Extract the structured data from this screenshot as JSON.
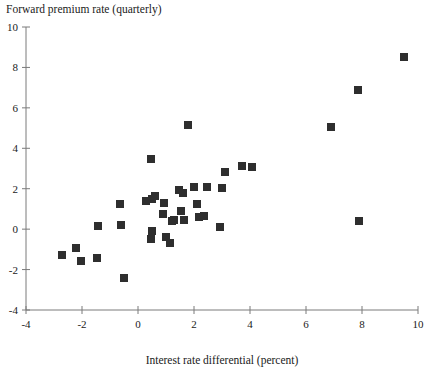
{
  "chart_data": {
    "type": "scatter",
    "title": "Forward premium rate (quarterly)",
    "xlabel": "Interest rate differential (percent)",
    "ylabel": "Forward premium rate (quarterly)",
    "xlim": [
      -4,
      10
    ],
    "ylim": [
      -4,
      10
    ],
    "xticks": [
      -4,
      -2,
      0,
      2,
      4,
      6,
      8,
      10
    ],
    "xtick_labels": [
      "-4",
      "-2",
      "0",
      "2",
      "4",
      "6",
      "8",
      "10"
    ],
    "yticks": [
      -4,
      -2,
      0,
      2,
      4,
      6,
      8,
      10
    ],
    "ytick_labels": [
      "-4",
      "-2",
      "0",
      "2",
      "4",
      "6",
      "8",
      "10"
    ],
    "grid": false,
    "legend": null,
    "marker": "square",
    "marker_color": "#2e2e2e",
    "marker_size": 8,
    "points": [
      {
        "x": -2.71,
        "y": -1.29
      },
      {
        "x": -2.21,
        "y": -0.94
      },
      {
        "x": -2.04,
        "y": -1.58
      },
      {
        "x": -1.46,
        "y": -1.44
      },
      {
        "x": -1.43,
        "y": 0.15
      },
      {
        "x": -0.61,
        "y": 0.2
      },
      {
        "x": -0.64,
        "y": 1.26
      },
      {
        "x": -0.5,
        "y": -2.43
      },
      {
        "x": 0.46,
        "y": 3.46
      },
      {
        "x": 0.29,
        "y": 1.39
      },
      {
        "x": 0.5,
        "y": 1.48
      },
      {
        "x": 0.61,
        "y": 1.63
      },
      {
        "x": 0.5,
        "y": -0.1
      },
      {
        "x": 0.46,
        "y": -0.49
      },
      {
        "x": 0.89,
        "y": 0.74
      },
      {
        "x": 0.93,
        "y": 1.29
      },
      {
        "x": 1.0,
        "y": -0.4
      },
      {
        "x": 1.14,
        "y": -0.69
      },
      {
        "x": 1.21,
        "y": 0.4
      },
      {
        "x": 1.29,
        "y": 0.45
      },
      {
        "x": 1.54,
        "y": 0.89
      },
      {
        "x": 1.61,
        "y": 1.78
      },
      {
        "x": 1.46,
        "y": 1.93
      },
      {
        "x": 1.79,
        "y": 5.15
      },
      {
        "x": 1.64,
        "y": 0.45
      },
      {
        "x": 2.0,
        "y": 2.08
      },
      {
        "x": 2.11,
        "y": 1.24
      },
      {
        "x": 2.18,
        "y": 0.59
      },
      {
        "x": 2.36,
        "y": 0.64
      },
      {
        "x": 2.46,
        "y": 2.08
      },
      {
        "x": 2.93,
        "y": 0.1
      },
      {
        "x": 3.0,
        "y": 2.03
      },
      {
        "x": 3.11,
        "y": 2.82
      },
      {
        "x": 4.07,
        "y": 3.07
      },
      {
        "x": 3.71,
        "y": 3.12
      },
      {
        "x": 6.89,
        "y": 5.05
      },
      {
        "x": 7.86,
        "y": 6.88
      },
      {
        "x": 7.89,
        "y": 0.4
      },
      {
        "x": 9.5,
        "y": 8.51
      }
    ]
  },
  "axis": {
    "x_axis_name": "x-axis",
    "y_axis_name": "y-axis"
  }
}
